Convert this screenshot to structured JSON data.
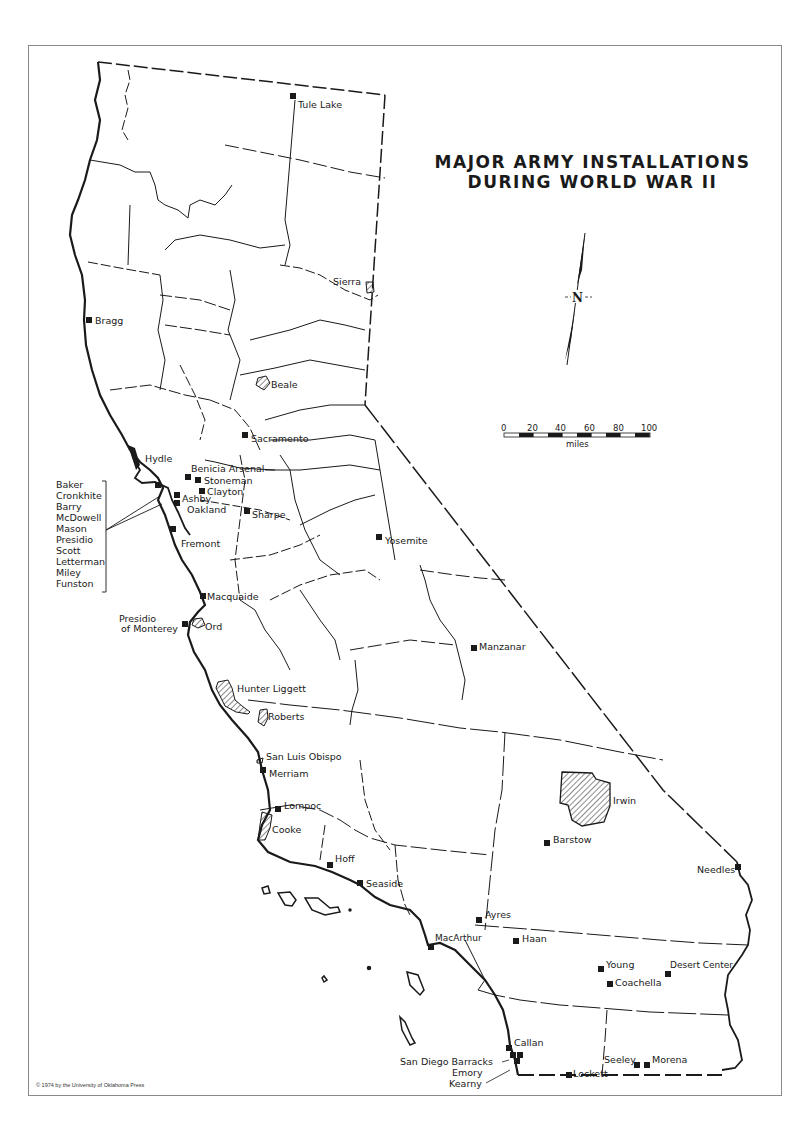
{
  "title": {
    "line1": "MAJOR ARMY INSTALLATIONS",
    "line2": "DURING WORLD WAR II"
  },
  "scale_bar": {
    "ticks": [
      "0",
      "20",
      "40",
      "60",
      "80",
      "100"
    ],
    "unit": "miles"
  },
  "north_arrow": {
    "label": "N"
  },
  "copyright": "© 1974 by the University of Oklahoma Press",
  "installations": [
    {
      "name": "Tule Lake",
      "type": "point"
    },
    {
      "name": "Sierra",
      "type": "area"
    },
    {
      "name": "Bragg",
      "type": "point"
    },
    {
      "name": "Beale",
      "type": "area"
    },
    {
      "name": "Sacramento",
      "type": "point"
    },
    {
      "name": "Hydle",
      "type": "point"
    },
    {
      "name": "Benicia Arsenal",
      "type": "point"
    },
    {
      "name": "Stoneman",
      "type": "point"
    },
    {
      "name": "Clayton",
      "type": "point"
    },
    {
      "name": "Ashby",
      "type": "point"
    },
    {
      "name": "Oakland",
      "type": "point"
    },
    {
      "name": "Sharpe",
      "type": "point"
    },
    {
      "name": "Fremont",
      "type": "point"
    },
    {
      "name": "Yosemite",
      "type": "point"
    },
    {
      "name": "Macquaide",
      "type": "point"
    },
    {
      "name": "Presidio of Monterey",
      "type": "point"
    },
    {
      "name": "Ord",
      "type": "area"
    },
    {
      "name": "Manzanar",
      "type": "point"
    },
    {
      "name": "Hunter Liggett",
      "type": "area"
    },
    {
      "name": "Roberts",
      "type": "area"
    },
    {
      "name": "San Luis Obispo",
      "type": "area"
    },
    {
      "name": "Merriam",
      "type": "point"
    },
    {
      "name": "Irwin",
      "type": "area"
    },
    {
      "name": "Lompoc",
      "type": "point"
    },
    {
      "name": "Cooke",
      "type": "area"
    },
    {
      "name": "Barstow",
      "type": "point"
    },
    {
      "name": "Needles",
      "type": "point"
    },
    {
      "name": "Hoff",
      "type": "point"
    },
    {
      "name": "Seaside",
      "type": "point"
    },
    {
      "name": "Ayres",
      "type": "point"
    },
    {
      "name": "MacArthur",
      "type": "point"
    },
    {
      "name": "Haan",
      "type": "point"
    },
    {
      "name": "Young",
      "type": "point"
    },
    {
      "name": "Desert Center",
      "type": "point"
    },
    {
      "name": "Coachella",
      "type": "point"
    },
    {
      "name": "Callan",
      "type": "point"
    },
    {
      "name": "San Diego Barracks",
      "type": "point"
    },
    {
      "name": "Emory",
      "type": "point"
    },
    {
      "name": "Kearny",
      "type": "point"
    },
    {
      "name": "Seeley",
      "type": "point"
    },
    {
      "name": "Morena",
      "type": "point"
    },
    {
      "name": "Lockett",
      "type": "point"
    }
  ],
  "sf_bay_group": {
    "items": [
      "Baker",
      "Cronkhite",
      "Barry",
      "McDowell",
      "Mason",
      "Presidio",
      "Scott",
      "Letterman",
      "Miley",
      "Funston"
    ]
  },
  "labels": {
    "tule_lake": "Tule Lake",
    "sierra": "Sierra",
    "bragg": "Bragg",
    "beale": "Beale",
    "sacramento": "Sacramento",
    "hydle": "Hydle",
    "benicia": "Benicia Arsenal",
    "stoneman": "Stoneman",
    "clayton": "Clayton",
    "ashby": "Ashby",
    "oakland": "Oakland",
    "sharpe": "Sharpe",
    "fremont": "Fremont",
    "yosemite": "Yosemite",
    "macquaide": "Macquaide",
    "presidio_monterey_1": "Presidio",
    "presidio_monterey_2": "of Monterey",
    "ord": "Ord",
    "manzanar": "Manzanar",
    "hunter_liggett": "Hunter Liggett",
    "roberts": "Roberts",
    "san_luis_obispo": "San Luis Obispo",
    "merriam": "Merriam",
    "irwin": "Irwin",
    "lompoc": "Lompoc",
    "cooke": "Cooke",
    "barstow": "Barstow",
    "needles": "Needles",
    "hoff": "Hoff",
    "seaside": "Seaside",
    "ayres": "Ayres",
    "macarthur": "MacArthur",
    "haan": "Haan",
    "young": "Young",
    "desert_center": "Desert Center",
    "coachella": "Coachella",
    "callan": "Callan",
    "sd_barracks": "San Diego Barracks",
    "emory": "Emory",
    "kearny": "Kearny",
    "seeley": "Seeley",
    "morena": "Morena",
    "lockett": "Lockett"
  },
  "colors": {
    "ink": "#1a1a1a",
    "frame": "#8a8a8a",
    "paper": "#ffffff"
  }
}
